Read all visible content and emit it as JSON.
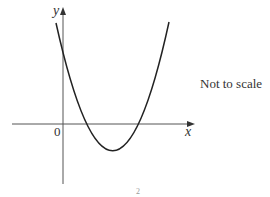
{
  "figure": {
    "type": "quadratic-graph-sketch",
    "axis_labels": {
      "x": "x",
      "y": "y",
      "origin": "0"
    },
    "note": "Not to scale",
    "bottom_mark": "2",
    "curve": {
      "shape": "upward parabola",
      "crosses_y_axis": "positive",
      "x_intercepts": "two positive roots",
      "vertex": "below x-axis, right of y-axis"
    },
    "colors": {
      "curve": "#222222",
      "axis": "#555555",
      "text": "#333333"
    }
  }
}
